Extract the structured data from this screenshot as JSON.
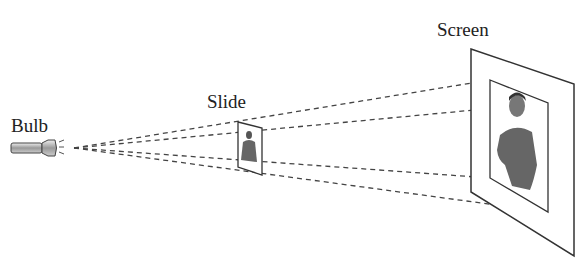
{
  "diagram": {
    "type": "projection-geometry",
    "labels": {
      "bulb": "Bulb",
      "slide": "Slide",
      "screen": "Screen"
    },
    "elements": [
      {
        "id": "bulb",
        "label": "Bulb",
        "shape": "flashlight-icon"
      },
      {
        "id": "slide",
        "label": "Slide",
        "shape": "small parallelogram with figure image"
      },
      {
        "id": "screen",
        "label": "Screen",
        "shape": "large parallelogram with projected enlarged figure image"
      }
    ],
    "relations": [
      {
        "from": "bulb",
        "to": "slide",
        "style": "dashed rays",
        "count": 4
      },
      {
        "from": "slide",
        "to": "screen",
        "style": "dashed rays extending to projected image corners",
        "count": 4
      }
    ],
    "colors": {
      "line": "#333333",
      "figure": "#666666",
      "background": "#ffffff"
    }
  }
}
